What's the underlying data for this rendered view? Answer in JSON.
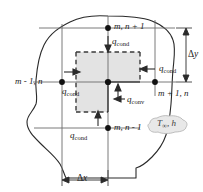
{
  "figure": {
    "type": "diagram",
    "nodes": [
      {
        "id": "node-top",
        "label": "m, n + 1",
        "x": 108,
        "y": 28
      },
      {
        "id": "node-left",
        "label": "m - 1, n",
        "x": 62,
        "y": 82
      },
      {
        "id": "node-center",
        "label": "",
        "x": 108,
        "y": 82
      },
      {
        "id": "node-right",
        "label": "m + 1, n",
        "x": 155,
        "y": 82
      },
      {
        "id": "node-bottom",
        "label": "m, n - 1",
        "x": 108,
        "y": 128
      }
    ],
    "heat_flows": [
      {
        "id": "q-cond-top",
        "label": "q",
        "sub": "cond"
      },
      {
        "id": "q-cond-left",
        "label": "q",
        "sub": "cond"
      },
      {
        "id": "q-cond-right",
        "label": "q",
        "sub": "cond"
      },
      {
        "id": "q-cond-bottom",
        "label": "q",
        "sub": "cond"
      },
      {
        "id": "q-conv",
        "label": "q",
        "sub": "conv"
      }
    ],
    "dimensions": [
      {
        "id": "delta-y",
        "symbol": "Δ",
        "var": "y"
      },
      {
        "id": "delta-x",
        "symbol": "Δ",
        "var": "x"
      }
    ],
    "ambient": {
      "temperature": "T",
      "subscript": "∞",
      "coefficient": "h",
      "separator": ", "
    },
    "colors": {
      "line": "#2a2a2a",
      "grid": "#6b6b6b",
      "shade": "#e3e3e3",
      "dash": "#3a3a3a",
      "cloud_fill": "#e8e8e8",
      "cloud_stroke": "#b8b8b8",
      "text": "#1a1a1a"
    }
  }
}
